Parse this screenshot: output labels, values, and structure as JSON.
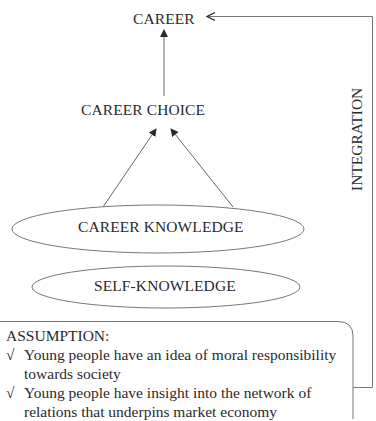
{
  "diagram": {
    "nodes": {
      "career": "CAREER",
      "career_choice": "CAREER CHOICE",
      "career_knowledge": "CAREER KNOWLEDGE",
      "self_knowledge": "SELF-KNOWLEDGE"
    },
    "side_label": "INTEGRATION",
    "assumption": {
      "title": "ASSUMPTION:",
      "check_icon": "√",
      "items": [
        "Young people have an idea of moral responsibility towards society",
        "Young people have insight into the network of relations that underpins market economy"
      ]
    },
    "edges": [
      {
        "from": "career_choice",
        "to": "career"
      },
      {
        "from": "career_knowledge",
        "to": "career_choice",
        "side": "left"
      },
      {
        "from": "career_knowledge",
        "to": "career_choice",
        "side": "right"
      },
      {
        "from": "assumption",
        "to": "career",
        "label": "INTEGRATION"
      }
    ],
    "colors": {
      "line": "#555555",
      "text": "#2a2a2a",
      "background": "#ffffff"
    }
  }
}
